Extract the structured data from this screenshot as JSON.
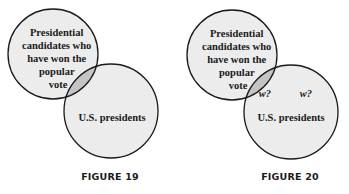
{
  "colors": {
    "circle_fill": "#ececec",
    "overlap_fill": "#c4c4c4",
    "stroke": "#1a1a1a"
  },
  "figures": [
    {
      "caption": "FIGURE 19",
      "set_a": {
        "lines": [
          "Presidential",
          "candidates who",
          "have won the",
          "popular",
          "vote"
        ]
      },
      "set_b": {
        "label": "U.S. presidents"
      },
      "markers": []
    },
    {
      "caption": "FIGURE 20",
      "set_a": {
        "lines": [
          "Presidential",
          "candidates who",
          "have won the",
          "popular",
          "vote"
        ]
      },
      "set_b": {
        "label": "U.S. presidents"
      },
      "markers": [
        "w?",
        "w?"
      ]
    }
  ]
}
